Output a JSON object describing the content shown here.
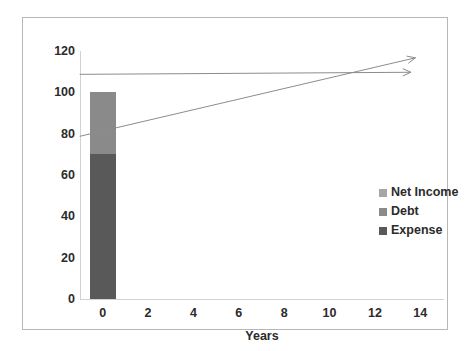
{
  "chart_data": {
    "type": "bar",
    "title": "",
    "subtitle": "",
    "xlabel": "Years",
    "ylabel": "",
    "xlim": [
      -1,
      15
    ],
    "ylim": [
      0,
      120
    ],
    "grid": false,
    "legend_position": "right",
    "x_ticks": [
      "0",
      "2",
      "4",
      "6",
      "8",
      "10",
      "12",
      "14"
    ],
    "x_tick_values": [
      0,
      2,
      4,
      6,
      8,
      10,
      12,
      14
    ],
    "y_ticks": [
      "0",
      "20",
      "40",
      "60",
      "80",
      "100",
      "120"
    ],
    "y_tick_values": [
      0,
      20,
      40,
      60,
      80,
      100,
      120
    ],
    "categories": [
      0
    ],
    "stacked": true,
    "series": [
      {
        "name": "Net Income",
        "values": [
          0
        ],
        "color": "#a6a6a6"
      },
      {
        "name": "Debt",
        "values": [
          30
        ],
        "color": "#8a8a8a",
        "range": [
          70,
          100
        ]
      },
      {
        "name": "Expense",
        "values": [
          70
        ],
        "color": "#595959",
        "range": [
          0,
          70
        ]
      }
    ],
    "annotations": [
      {
        "name": "debt-trend-arrow",
        "type": "arrow",
        "from": [
          0,
          100
        ],
        "to": [
          14.6,
          101
        ],
        "color": "#8c8c8c"
      },
      {
        "name": "expense-trend-arrow",
        "type": "arrow",
        "from": [
          0,
          70
        ],
        "to": [
          14.8,
          108
        ],
        "color": "#8c8c8c"
      }
    ]
  },
  "legend": {
    "items": [
      {
        "label": "Net Income",
        "color": "#a6a6a6"
      },
      {
        "label": "Debt",
        "color": "#8a8a8a"
      },
      {
        "label": "Expense",
        "color": "#595959"
      }
    ]
  },
  "axes": {
    "x_title": "Years",
    "y_title": ""
  },
  "colors": {
    "frame": "#b7b7b7",
    "axis": "#d2d2d2",
    "text": "#2b2b2b",
    "background": "#ffffff"
  }
}
